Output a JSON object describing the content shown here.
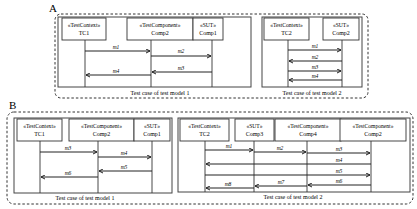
{
  "panels": [
    {
      "label": "A",
      "test_cases": [
        {
          "caption": "Test case of test model 1",
          "lifelines": [
            {
              "stereotype": "«TestContext»",
              "name": "TC1"
            },
            {
              "stereotype": "«TestComponent»",
              "name": "Comp2"
            },
            {
              "stereotype": "«SUT»",
              "name": "Comp1"
            }
          ],
          "messages": [
            {
              "label": "m1",
              "from": "TC1",
              "to": "Comp2"
            },
            {
              "label": "m2",
              "from": "Comp2",
              "to": "Comp1"
            },
            {
              "label": "m3",
              "from": "Comp1",
              "to": "Comp2"
            },
            {
              "label": "m4",
              "from": "Comp2",
              "to": "TC1"
            }
          ]
        },
        {
          "caption": "Test case of test model 2",
          "lifelines": [
            {
              "stereotype": "«TestContext»",
              "name": "TC2"
            },
            {
              "stereotype": "«SUT»",
              "name": "Comp2"
            }
          ],
          "messages": [
            {
              "label": "m1",
              "from": "TC2",
              "to": "Comp2"
            },
            {
              "label": "m2",
              "from": "Comp2",
              "to": "TC2"
            },
            {
              "label": "m3",
              "from": "TC2",
              "to": "Comp2"
            },
            {
              "label": "m4",
              "from": "Comp2",
              "to": "TC2"
            }
          ]
        }
      ]
    },
    {
      "label": "B",
      "test_cases": [
        {
          "caption": "Test case of test model 1",
          "lifelines": [
            {
              "stereotype": "«TestContext»",
              "name": "TC1"
            },
            {
              "stereotype": "«TestComponent»",
              "name": "Comp2"
            },
            {
              "stereotype": "«SUT»",
              "name": "Comp1"
            }
          ],
          "messages": [
            {
              "label": "m3",
              "from": "TC1",
              "to": "Comp2"
            },
            {
              "label": "m4",
              "from": "Comp2",
              "to": "Comp1"
            },
            {
              "label": "m5",
              "from": "Comp1",
              "to": "Comp2"
            },
            {
              "label": "m6",
              "from": "Comp2",
              "to": "TC1"
            }
          ]
        },
        {
          "caption": "Test case of test model 2",
          "lifelines": [
            {
              "stereotype": "«TestContext»",
              "name": "TC2"
            },
            {
              "stereotype": "«SUT»",
              "name": "Comp3"
            },
            {
              "stereotype": "«TestComponent»",
              "name": "Comp4"
            },
            {
              "stereotype": "«TestComponent»",
              "name": "Comp2"
            }
          ],
          "messages": [
            {
              "label": "m1",
              "from": "TC2",
              "to": "Comp3"
            },
            {
              "label": "m2",
              "from": "Comp3",
              "to": "Comp4"
            },
            {
              "label": "m3",
              "from": "Comp4",
              "to": "Comp2"
            },
            {
              "label": "m4",
              "from": "Comp2",
              "to": "TC2"
            },
            {
              "label": "m5",
              "from": "TC2",
              "to": "Comp2"
            },
            {
              "label": "m6",
              "from": "Comp2",
              "to": "Comp4"
            },
            {
              "label": "m7",
              "from": "Comp4",
              "to": "Comp3"
            },
            {
              "label": "m8",
              "from": "Comp3",
              "to": "TC2"
            }
          ]
        }
      ]
    }
  ]
}
